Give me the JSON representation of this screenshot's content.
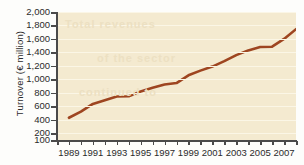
{
  "chart_data": {
    "type": "line",
    "title": "",
    "xlabel": "",
    "ylabel": "Turnover (€ million)",
    "ylim": [
      100,
      2000
    ],
    "xlim": [
      1988,
      2008
    ],
    "grid": true,
    "legend": "none",
    "line_color": "#9e4520",
    "plot_background": "#f4ead0",
    "y_ticks": [
      2000,
      1800,
      1600,
      1400,
      1200,
      1000,
      800,
      600,
      400,
      200,
      100
    ],
    "y_tick_labels": [
      "2,000",
      "1,800",
      "1,600",
      "1,400",
      "1,200",
      "1,000",
      "800",
      "600",
      "400",
      "200",
      "100"
    ],
    "x_ticks": [
      1988,
      1989,
      1990,
      1991,
      1992,
      1993,
      1994,
      1995,
      1996,
      1997,
      1998,
      1999,
      2000,
      2001,
      2002,
      2003,
      2004,
      2005,
      2006,
      2007,
      2008
    ],
    "x_tick_labels": [
      "1989",
      "1991",
      "1993",
      "1995",
      "1997",
      "1999",
      "2001",
      "2003",
      "2005",
      "2007"
    ],
    "x_tick_label_years": [
      1989,
      1991,
      1993,
      1995,
      1997,
      1999,
      2001,
      2003,
      2005,
      2007
    ],
    "x": [
      1989,
      1990,
      1991,
      1992,
      1993,
      1994,
      1995,
      1996,
      1997,
      1998,
      1999,
      2000,
      2001,
      2002,
      2003,
      2004,
      2005,
      2006,
      2007,
      2008
    ],
    "values": [
      430,
      520,
      635,
      690,
      745,
      750,
      820,
      875,
      925,
      945,
      1060,
      1130,
      1190,
      1270,
      1360,
      1430,
      1480,
      1485,
      1600,
      1745
    ],
    "series": [
      {
        "name": "Turnover",
        "color": "#9e4520",
        "values": [
          430,
          520,
          635,
          690,
          745,
          750,
          820,
          875,
          925,
          945,
          1060,
          1130,
          1190,
          1270,
          1360,
          1430,
          1480,
          1485,
          1600,
          1745
        ]
      }
    ],
    "ghost_text": [
      "Total revenues",
      "of the sector",
      "continued to"
    ]
  }
}
